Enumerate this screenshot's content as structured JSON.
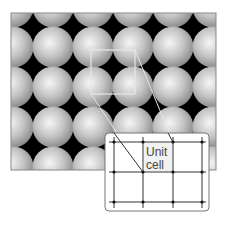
{
  "diagram": {
    "inset_label_line1": "Unit",
    "inset_label_line2": "cell",
    "colors": {
      "background": "#000000",
      "sphere_light": "#f4f4f4",
      "sphere_dark": "#8c8c8c",
      "outline": "#e8e8e8",
      "grid": "#333333"
    }
  }
}
